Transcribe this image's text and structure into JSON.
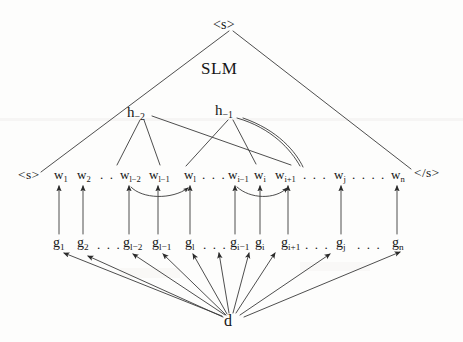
{
  "figure": {
    "type": "tree-diagram",
    "root_label": "<s>",
    "model_label": "SLM",
    "head_nodes": [
      {
        "name": "h-minus-2",
        "base": "h",
        "sub": "−2"
      },
      {
        "name": "h-minus-1",
        "base": "h",
        "sub": "−1"
      }
    ],
    "sentence_start": "<s>",
    "sentence_end": "</s>",
    "words": [
      {
        "base": "w",
        "sub": "1"
      },
      {
        "base": "w",
        "sub": "2"
      },
      {
        "base": "w",
        "sub": "l−2"
      },
      {
        "base": "w",
        "sub": "l−1"
      },
      {
        "base": "w",
        "sub": "l"
      },
      {
        "base": "w",
        "sub": "i−1"
      },
      {
        "base": "w",
        "sub": "i"
      },
      {
        "base": "w",
        "sub": "i+1"
      },
      {
        "base": "w",
        "sub": "j"
      },
      {
        "base": "w",
        "sub": "n"
      }
    ],
    "tags": [
      {
        "base": "g",
        "sub": "1"
      },
      {
        "base": "g",
        "sub": "2"
      },
      {
        "base": "g",
        "sub": "l−2"
      },
      {
        "base": "g",
        "sub": "l−1"
      },
      {
        "base": "g",
        "sub": "l"
      },
      {
        "base": "g",
        "sub": "i−1"
      },
      {
        "base": "g",
        "sub": "i"
      },
      {
        "base": "g",
        "sub": "i+1"
      },
      {
        "base": "g",
        "sub": "j"
      },
      {
        "base": "g",
        "sub": "n"
      }
    ],
    "ellipses": {
      "short": ". .",
      "medium": ". . .",
      "long": ". . . ."
    },
    "data_node": "d",
    "ink_color": "#161616",
    "line_color": "#3a3a3a",
    "background_color": "#fdfdfc"
  }
}
